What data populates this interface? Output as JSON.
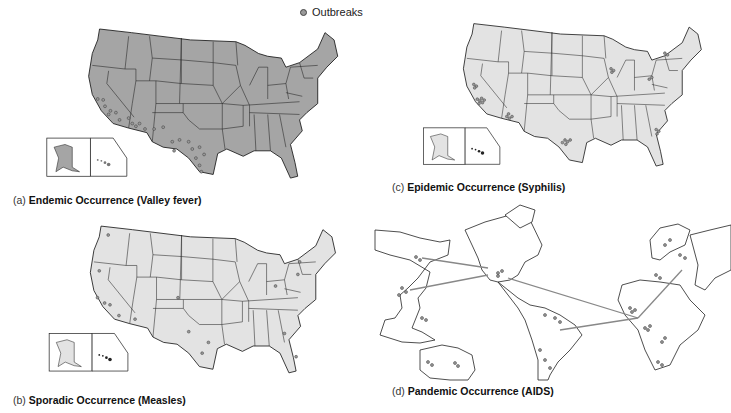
{
  "legend": {
    "marker_icon": "outbreak-dot",
    "label": "Outbreaks"
  },
  "colors": {
    "endemic_fill": "#a5a5a5",
    "light_fill": "#e3e3e3",
    "border": "#111111",
    "outbreak_dot": "#999999",
    "route_line": "#888888"
  },
  "panels": [
    {
      "id": "a",
      "letter": "(a)",
      "title": "Endemic Occurrence (Valley fever)",
      "map": "United States"
    },
    {
      "id": "b",
      "letter": "(b)",
      "title": "Sporadic Occurrence (Measles)",
      "map": "United States"
    },
    {
      "id": "c",
      "letter": "(c)",
      "title": "Epidemic Occurrence (Syphilis)",
      "map": "United States"
    },
    {
      "id": "d",
      "letter": "(d)",
      "title": "Pandemic Occurrence (AIDS)",
      "map": "World"
    }
  ]
}
